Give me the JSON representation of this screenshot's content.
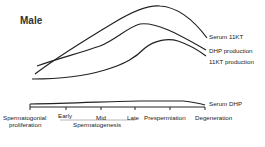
{
  "title": "Male",
  "curves": [
    {
      "name": "Serum 11KT",
      "label": "Serum 11KT"
    },
    {
      "name": "DHP production",
      "label": "DHP production"
    },
    {
      "name": "11KT production",
      "label": "11KT production"
    },
    {
      "name": "Serum DHP",
      "label": "Serum DHP"
    }
  ],
  "stages": [
    {
      "label": "Spermatogonial",
      "label2": "proliferation"
    },
    {
      "label": "Early"
    },
    {
      "label": "Mid"
    },
    {
      "label": "Late"
    },
    {
      "label": "Prespermiation"
    },
    {
      "label": "Degeneration"
    }
  ],
  "group_label": "Spermatogenesis",
  "colors": {
    "line": "#222222",
    "text": "#222222"
  }
}
